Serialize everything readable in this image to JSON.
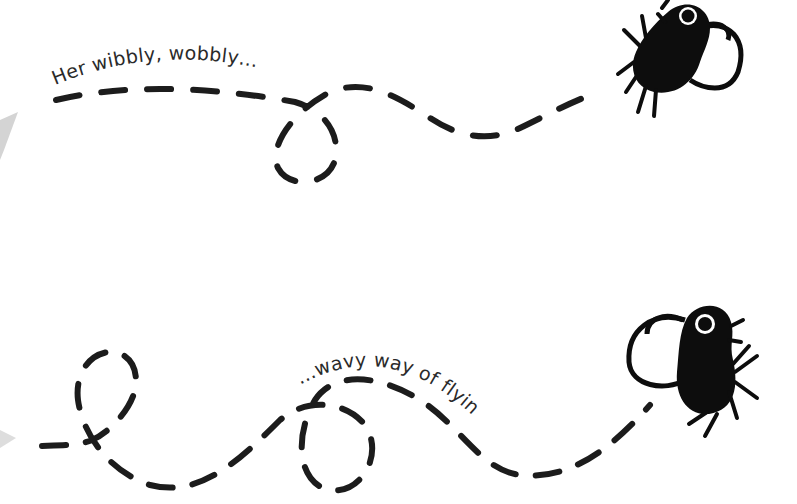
{
  "illustration": {
    "top": {
      "caption": "Her wibbly, wobbly…",
      "fly": "fly-icon"
    },
    "bottom": {
      "caption": "…wavy way of flying.",
      "fly": "fly-icon"
    },
    "colors": {
      "background": "#ffffff",
      "ink": "#0d0d0d",
      "text": "#2a2a2a",
      "page_edge": "#cccccc"
    }
  }
}
